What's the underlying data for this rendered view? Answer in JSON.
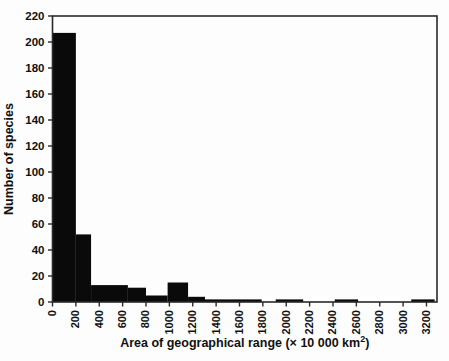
{
  "figure": {
    "background": "#fdfdfd",
    "bar_color": "#0a0a0a",
    "axis_color": "#2a2a2a",
    "tick_label_color": "#111111"
  },
  "chart_data": {
    "type": "bar",
    "subtype": "histogram",
    "title": "",
    "ylabel": "Number of species",
    "xlabel_prefix": "Area of geographical range (",
    "xlabel_times": "×",
    "xlabel_mid": " 10 000 km",
    "xlabel_sup": "2",
    "xlabel_suffix": ")",
    "xlim": [
      0,
      3290
    ],
    "ylim": [
      0,
      220
    ],
    "x_ticks": [
      0,
      200,
      400,
      600,
      800,
      1000,
      1200,
      1400,
      1600,
      1800,
      2000,
      2200,
      2400,
      2600,
      2800,
      3000,
      3200
    ],
    "y_ticks": [
      0,
      20,
      40,
      60,
      80,
      100,
      120,
      140,
      160,
      180,
      200,
      220
    ],
    "grid": false,
    "legend": "none",
    "nominal_bin_width": 200,
    "values_per_200_bin": [
      207,
      52,
      13,
      11,
      5,
      15,
      4,
      2,
      2,
      0,
      2,
      0,
      2,
      0,
      0,
      2,
      0
    ],
    "bars": [
      {
        "x0": 0,
        "x1": 200,
        "y": 207
      },
      {
        "x0": 200,
        "x1": 330,
        "y": 52
      },
      {
        "x0": 330,
        "x1": 645,
        "y": 13
      },
      {
        "x0": 645,
        "x1": 800,
        "y": 11
      },
      {
        "x0": 800,
        "x1": 985,
        "y": 5
      },
      {
        "x0": 985,
        "x1": 1160,
        "y": 15
      },
      {
        "x0": 1160,
        "x1": 1305,
        "y": 4
      },
      {
        "x0": 1305,
        "x1": 1790,
        "y": 2
      },
      {
        "x0": 1910,
        "x1": 2145,
        "y": 2
      },
      {
        "x0": 2415,
        "x1": 2615,
        "y": 2
      },
      {
        "x0": 3070,
        "x1": 3270,
        "y": 2
      }
    ]
  }
}
